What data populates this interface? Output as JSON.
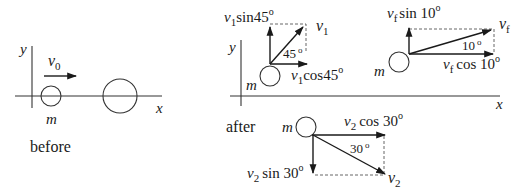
{
  "before": {
    "caption": "before",
    "axis_x": "x",
    "axis_y": "y",
    "mass_label": "m",
    "velocity": {
      "symbol": "v",
      "sub": "0"
    }
  },
  "after": {
    "caption": "after",
    "axis_x": "x",
    "axis_y": "y",
    "ball_1": {
      "mass_label": "m",
      "velocity": {
        "symbol": "v",
        "sub": "1"
      },
      "angle": "45",
      "angle_label": "45 o",
      "comp_y": {
        "symbol": "v",
        "sub": "1",
        "text": "sin45",
        "deg": "o"
      },
      "comp_x": {
        "symbol": "v",
        "sub": "1",
        "text": "cos45",
        "deg": "o"
      }
    },
    "ball_f": {
      "mass_label": "m",
      "velocity": {
        "symbol": "v",
        "sub": "f"
      },
      "angle": "10",
      "comp_y": {
        "symbol": "v",
        "sub": "f",
        "text": "sin 10",
        "deg": "o"
      },
      "comp_x": {
        "symbol": "v",
        "sub": "f",
        "text": "cos 10",
        "deg": "o"
      }
    },
    "ball_2": {
      "mass_label": "m",
      "velocity": {
        "symbol": "v",
        "sub": "2"
      },
      "angle": "30",
      "comp_x": {
        "symbol": "v",
        "sub": "2",
        "text": "cos 30",
        "deg": "o"
      },
      "comp_y": {
        "symbol": "v",
        "sub": "2",
        "text": "sin 30",
        "deg": "o"
      }
    }
  },
  "degree_symbol": "o",
  "colors": {
    "ink": "#1a1a1a",
    "background": "#ffffff"
  }
}
